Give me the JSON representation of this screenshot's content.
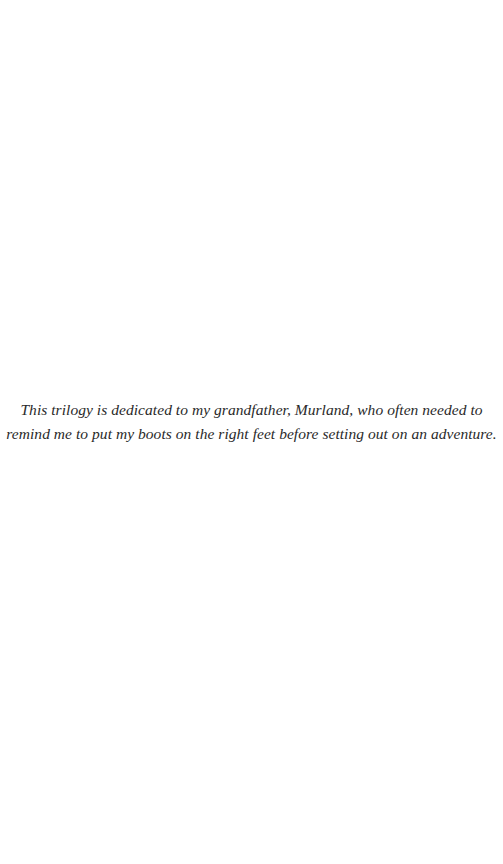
{
  "page": {
    "background": "#ffffff",
    "text_color": "#2a2a2a"
  },
  "dedication": {
    "lines": [
      "This trilogy is dedicated to my grandfather, Murland, who often needed to",
      "remind me to put my boots on the right feet before setting out on an adventure."
    ]
  }
}
